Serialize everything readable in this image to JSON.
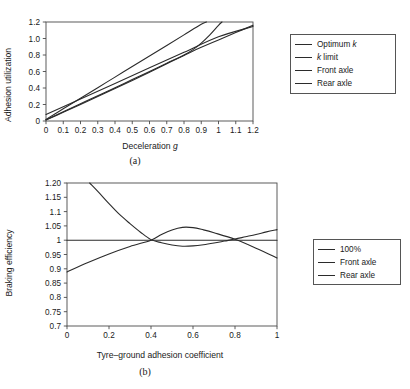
{
  "figure": {
    "panel_a_caption": "(a)",
    "panel_b_caption": "(b)"
  },
  "panel_a": {
    "legend": {
      "items": [
        {
          "label": "Optimum k",
          "italic_tail": "k",
          "label_plain": "Optimum ",
          "color": "#2b2b2b"
        },
        {
          "label": "k limit",
          "italic_head": "k",
          "label_plain": " limit",
          "color": "#2b2b2b"
        },
        {
          "label": "Front axle",
          "color": "#2b2b2b"
        },
        {
          "label": "Rear axle",
          "color": "#2b2b2b"
        }
      ]
    }
  },
  "panel_b": {
    "legend": {
      "items": [
        {
          "label": "100%",
          "color": "#2b2b2b"
        },
        {
          "label": "Front axle",
          "color": "#2b2b2b"
        },
        {
          "label": "Rear axle",
          "color": "#2b2b2b"
        }
      ]
    }
  },
  "chart_data": [
    {
      "id": "panel-a",
      "type": "line",
      "title": "",
      "xlabel": "Deceleration g",
      "xlabel_italic_part": "g",
      "ylabel": "Adhesion utilization",
      "xlim": [
        0,
        1.2
      ],
      "ylim": [
        0,
        1.2
      ],
      "xticks": [
        0,
        0.1,
        0.2,
        0.3,
        0.4,
        0.5,
        0.6,
        0.7,
        0.8,
        0.9,
        1,
        1.1,
        1.2
      ],
      "xticklabels": [
        "0",
        "0.1",
        "0.2",
        "0.3",
        "0.4",
        "0.5",
        "0.6",
        "0.7",
        "0.8",
        "0.9",
        "1",
        "1.1",
        "1.2"
      ],
      "yticks": [
        0,
        0.2,
        0.4,
        0.6,
        0.8,
        1.0,
        1.2
      ],
      "yticklabels": [
        "0",
        "0.2",
        "0.4",
        "0.6",
        "0.8",
        "1.0",
        "1.2"
      ],
      "grid": false,
      "legend_position": "right-outside",
      "series": [
        {
          "name": "Optimum k",
          "color": "#2b2b2b",
          "x": [
            0,
            0.1,
            0.2,
            0.3,
            0.4,
            0.5,
            0.6,
            0.7,
            0.8,
            0.9,
            0.93
          ],
          "y": [
            0.02,
            0.148,
            0.276,
            0.404,
            0.532,
            0.66,
            0.788,
            0.916,
            1.044,
            1.172,
            1.2
          ]
        },
        {
          "name": "k limit",
          "color": "#2b2b2b",
          "x": [
            0,
            0.2,
            0.4,
            0.6,
            0.8,
            1.0,
            1.2
          ],
          "y": [
            0.08,
            0.268,
            0.456,
            0.644,
            0.832,
            1.02,
            1.145
          ]
        },
        {
          "name": "Front axle",
          "color": "#2b2b2b",
          "x": [
            0,
            0.1,
            0.2,
            0.3,
            0.4,
            0.5,
            0.6,
            0.7,
            0.8,
            0.85,
            0.9,
            0.95,
            1.0,
            1.02
          ],
          "y": [
            0.015,
            0.112,
            0.209,
            0.306,
            0.404,
            0.502,
            0.601,
            0.7,
            0.8,
            0.862,
            0.945,
            1.045,
            1.16,
            1.2
          ]
        },
        {
          "name": "Rear axle",
          "color": "#2b2b2b",
          "x": [
            0,
            0.1,
            0.2,
            0.3,
            0.4,
            0.5,
            0.6,
            0.7,
            0.8,
            0.85,
            0.9,
            1.0,
            1.1,
            1.2
          ],
          "y": [
            0.012,
            0.105,
            0.2,
            0.296,
            0.393,
            0.492,
            0.592,
            0.693,
            0.795,
            0.846,
            0.893,
            0.983,
            1.072,
            1.16
          ]
        }
      ]
    },
    {
      "id": "panel-b",
      "type": "line",
      "title": "",
      "xlabel": "Tyre–ground adhesion coefficient",
      "ylabel": "Braking efficiency",
      "xlim": [
        0,
        1
      ],
      "ylim": [
        0.7,
        1.2
      ],
      "xticks": [
        0,
        0.2,
        0.4,
        0.6,
        0.8,
        1
      ],
      "xticklabels": [
        "0",
        "0.2",
        "0.4",
        "0.6",
        "0.8",
        "1"
      ],
      "yticks": [
        0.7,
        0.75,
        0.8,
        0.85,
        0.9,
        0.95,
        1,
        1.05,
        1.1,
        1.15,
        1.2
      ],
      "yticklabels": [
        "0.7",
        "0.75",
        "0.8",
        "0.85",
        "0.9",
        "0.95",
        "1",
        "1.05",
        "1.1",
        "1.15",
        "1.20"
      ],
      "grid": false,
      "legend_position": "right-outside",
      "series": [
        {
          "name": "100%",
          "color": "#2b2b2b",
          "x": [
            0,
            1
          ],
          "y": [
            1.0,
            1.0
          ]
        },
        {
          "name": "Front axle",
          "color": "#2b2b2b",
          "x": [
            0,
            0.1,
            0.2,
            0.3,
            0.4,
            0.45,
            0.5,
            0.55,
            0.6,
            0.65,
            0.7,
            0.8,
            0.9,
            1.0
          ],
          "y": [
            0.889,
            0.922,
            0.952,
            0.978,
            1.0,
            1.02,
            1.036,
            1.045,
            1.044,
            1.036,
            1.026,
            1.003,
            0.972,
            0.938
          ]
        },
        {
          "name": "Rear axle",
          "color": "#2b2b2b",
          "x": [
            0.108,
            0.15,
            0.2,
            0.25,
            0.3,
            0.35,
            0.4,
            0.45,
            0.5,
            0.55,
            0.6,
            0.65,
            0.7,
            0.75,
            0.8,
            0.85,
            0.9,
            0.95,
            1.0
          ],
          "y": [
            1.2,
            1.168,
            1.128,
            1.09,
            1.058,
            1.028,
            1.002,
            0.991,
            0.983,
            0.979,
            0.98,
            0.984,
            0.99,
            0.997,
            1.004,
            1.012,
            1.02,
            1.029,
            1.037
          ]
        }
      ]
    }
  ]
}
